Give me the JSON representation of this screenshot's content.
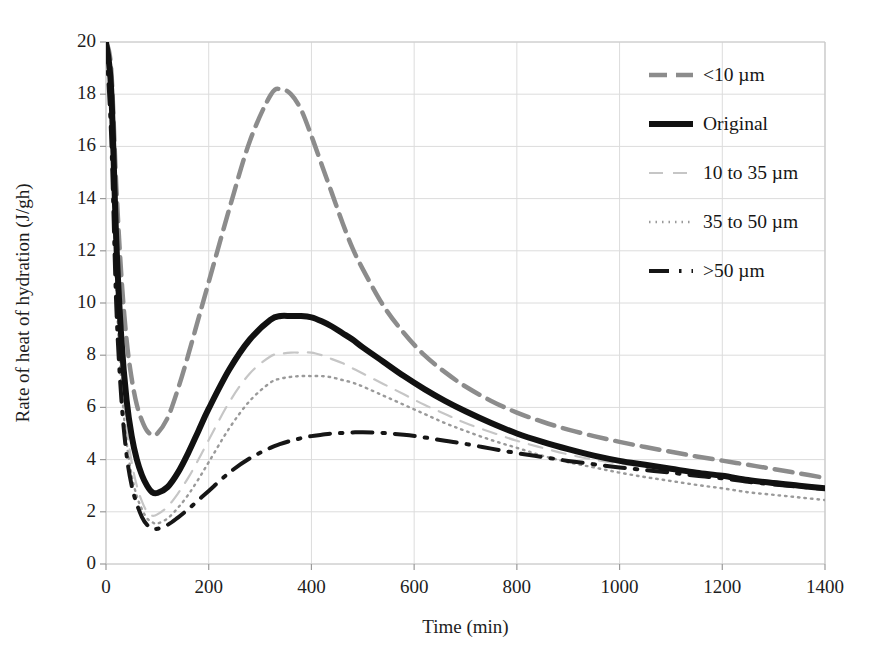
{
  "figure": {
    "background": "#ffffff",
    "plot_frame_color": "#c9c9c9",
    "grid_color": "#dcdcdc"
  },
  "axes": {
    "x_title": "Time (min)",
    "y_title": "Rate of heat of hydration (J/gh)",
    "x_ticks": [
      "0",
      "200",
      "400",
      "600",
      "800",
      "1000",
      "1200",
      "1400"
    ],
    "y_ticks": [
      "0",
      "2",
      "4",
      "6",
      "8",
      "10",
      "12",
      "14",
      "16",
      "18",
      "20"
    ]
  },
  "legend": {
    "items": [
      {
        "label": "<10 µm",
        "color": "#8c8c8c",
        "width": 4.5,
        "dash": "18 9",
        "style_name": "long-dash-gray"
      },
      {
        "label": "Original",
        "color": "#111111",
        "width": 6.0,
        "dash": "none",
        "style_name": "thick-solid-black"
      },
      {
        "label": "10 to 35 µm",
        "color": "#c6c6c6",
        "width": 2.2,
        "dash": "14 10",
        "style_name": "dash-light-gray"
      },
      {
        "label": "35 to 50 µm",
        "color": "#9a9a9a",
        "width": 2.4,
        "dash": "1.5 5",
        "style_name": "dotted-gray"
      },
      {
        "label": ">50 µm",
        "color": "#161616",
        "width": 4.0,
        "dash": "20 10 2.5 10",
        "style_name": "dash-dot-black"
      }
    ]
  },
  "chart_data": {
    "type": "line",
    "title": "",
    "xlabel": "Time (min)",
    "ylabel": "Rate of heat of hydration (J/gh)",
    "xlim": [
      0,
      1400
    ],
    "ylim": [
      0,
      20
    ],
    "xticks": [
      0,
      200,
      400,
      600,
      800,
      1000,
      1200,
      1400
    ],
    "yticks": [
      0,
      2,
      4,
      6,
      8,
      10,
      12,
      14,
      16,
      18,
      20
    ],
    "grid": true,
    "legend_position": "upper right",
    "x": [
      0,
      10,
      20,
      30,
      40,
      50,
      60,
      70,
      80,
      90,
      100,
      120,
      140,
      160,
      180,
      200,
      240,
      280,
      320,
      340,
      360,
      380,
      400,
      420,
      440,
      460,
      480,
      500,
      540,
      580,
      620,
      660,
      700,
      750,
      800,
      850,
      900,
      950,
      1000,
      1050,
      1100,
      1150,
      1200,
      1250,
      1300,
      1350,
      1400
    ],
    "series": [
      {
        "name": "<10 µm",
        "style": "long-dash-gray",
        "color": "#8c8c8c",
        "peak": {
          "x": 340,
          "y": 18.2
        },
        "min": {
          "x": 95,
          "y": 4.95
        },
        "end": {
          "x": 1400,
          "y": 3.3
        },
        "values": [
          20.0,
          19.0,
          14.5,
          11.0,
          8.6,
          7.1,
          6.1,
          5.5,
          5.1,
          4.95,
          5.0,
          5.6,
          6.7,
          8.0,
          9.4,
          10.8,
          13.6,
          16.2,
          17.95,
          18.2,
          18.0,
          17.4,
          16.4,
          15.3,
          14.2,
          13.1,
          12.1,
          11.3,
          9.9,
          8.85,
          8.0,
          7.35,
          6.8,
          6.25,
          5.8,
          5.45,
          5.15,
          4.9,
          4.68,
          4.48,
          4.3,
          4.12,
          3.96,
          3.8,
          3.64,
          3.47,
          3.3
        ]
      },
      {
        "name": "Original",
        "style": "thick-solid-black",
        "color": "#111111",
        "peak": {
          "x": 400,
          "y": 9.5
        },
        "min": {
          "x": 95,
          "y": 2.72
        },
        "end": {
          "x": 1400,
          "y": 2.9
        },
        "values": [
          20.0,
          18.2,
          12.4,
          8.6,
          6.3,
          4.9,
          4.0,
          3.4,
          3.0,
          2.75,
          2.72,
          2.95,
          3.5,
          4.25,
          5.1,
          5.95,
          7.45,
          8.6,
          9.35,
          9.5,
          9.5,
          9.5,
          9.45,
          9.3,
          9.1,
          8.85,
          8.6,
          8.3,
          7.75,
          7.2,
          6.7,
          6.25,
          5.85,
          5.4,
          5.0,
          4.68,
          4.4,
          4.15,
          3.95,
          3.8,
          3.65,
          3.5,
          3.38,
          3.22,
          3.1,
          3.0,
          2.9
        ]
      },
      {
        "name": "10 to 35 µm",
        "style": "dash-light-gray",
        "color": "#c6c6c6",
        "peak": {
          "x": 400,
          "y": 8.1
        },
        "min": {
          "x": 90,
          "y": 1.85
        },
        "end": {
          "x": 1400,
          "y": 2.88
        },
        "values": [
          20.0,
          17.6,
          11.4,
          7.6,
          5.3,
          3.9,
          3.0,
          2.4,
          2.0,
          1.85,
          1.9,
          2.2,
          2.7,
          3.3,
          4.0,
          4.75,
          6.2,
          7.3,
          7.95,
          8.05,
          8.1,
          8.1,
          8.1,
          8.0,
          7.85,
          7.7,
          7.5,
          7.3,
          6.9,
          6.5,
          6.1,
          5.75,
          5.4,
          5.05,
          4.72,
          4.45,
          4.2,
          4.0,
          3.85,
          3.72,
          3.6,
          3.46,
          3.35,
          3.2,
          3.08,
          2.98,
          2.88
        ]
      },
      {
        "name": "35 to 50 µm",
        "style": "dotted-gray",
        "color": "#9a9a9a",
        "peak": {
          "x": 430,
          "y": 7.2
        },
        "min": {
          "x": 100,
          "y": 1.55
        },
        "end": {
          "x": 1400,
          "y": 2.45
        },
        "values": [
          20.0,
          17.0,
          10.6,
          6.9,
          4.7,
          3.4,
          2.6,
          2.1,
          1.75,
          1.6,
          1.55,
          1.75,
          2.15,
          2.65,
          3.25,
          3.9,
          5.2,
          6.25,
          6.95,
          7.1,
          7.17,
          7.2,
          7.2,
          7.2,
          7.15,
          7.05,
          6.95,
          6.8,
          6.45,
          6.1,
          5.75,
          5.4,
          5.1,
          4.75,
          4.45,
          4.15,
          3.9,
          3.7,
          3.5,
          3.33,
          3.18,
          3.03,
          2.9,
          2.75,
          2.65,
          2.55,
          2.45
        ]
      },
      {
        "name": ">50 µm",
        "style": "dash-dot-black",
        "color": "#161616",
        "peak": {
          "x": 490,
          "y": 5.05
        },
        "min": {
          "x": 105,
          "y": 1.35
        },
        "end": {
          "x": 1400,
          "y": 2.88
        },
        "values": [
          20.0,
          16.4,
          9.9,
          6.3,
          4.2,
          3.0,
          2.3,
          1.8,
          1.5,
          1.38,
          1.35,
          1.5,
          1.78,
          2.1,
          2.45,
          2.8,
          3.5,
          4.05,
          4.45,
          4.6,
          4.72,
          4.82,
          4.9,
          4.95,
          5.0,
          5.02,
          5.04,
          5.05,
          5.02,
          4.95,
          4.85,
          4.72,
          4.6,
          4.42,
          4.25,
          4.1,
          3.95,
          3.82,
          3.7,
          3.6,
          3.5,
          3.38,
          3.28,
          3.15,
          3.05,
          2.96,
          2.88
        ]
      }
    ]
  }
}
